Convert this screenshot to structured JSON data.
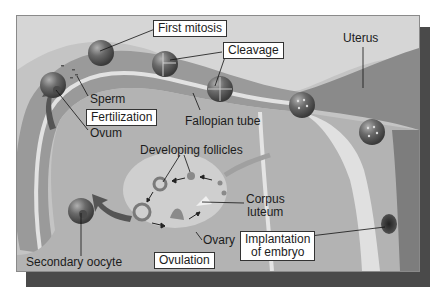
{
  "diagram": {
    "labels": {
      "first_mitosis": "First mitosis",
      "cleavage": "Cleavage",
      "uterus": "Uterus",
      "sperm": "Sperm",
      "fertilization": "Fertilization",
      "ovum": "Ovum",
      "fallopian_tube": "Fallopian tube",
      "developing_follicles": "Developing follicles",
      "corpus_luteum_1": "Corpus",
      "corpus_luteum_2": "luteum",
      "ovary": "Ovary",
      "secondary_oocyte": "Secondary oocyte",
      "ovulation": "Ovulation",
      "implantation_1": "Implantation",
      "implantation_2": "of embryo"
    },
    "colors": {
      "background": "#bdbdbd",
      "tube": "#8f8f8f",
      "tube_lumen": "#d9d9d9",
      "cell": "#5a5a5a",
      "shadow": "#4a4a4a",
      "label_box": "#ffffff"
    }
  }
}
